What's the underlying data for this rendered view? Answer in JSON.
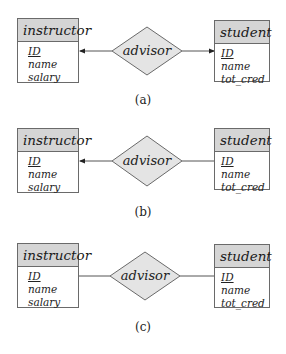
{
  "diagrams": [
    {
      "caption": "(a)",
      "left_entity": {
        "name": "instructor",
        "attributes": [
          {
            "label": "ID",
            "primary_key": true
          },
          {
            "label": "name"
          },
          {
            "label": "salary"
          }
        ]
      },
      "right_entity": {
        "name": "student",
        "attributes": [
          {
            "label": "ID",
            "primary_key": true
          },
          {
            "label": "name"
          },
          {
            "label": "tot_cred"
          }
        ]
      },
      "relationship": "advisor",
      "left_arrow": true,
      "right_arrow": true,
      "description": "one-to-one"
    },
    {
      "caption": "(b)",
      "left_entity": {
        "name": "instructor",
        "attributes": [
          {
            "label": "ID",
            "primary_key": true
          },
          {
            "label": "name"
          },
          {
            "label": "salary"
          }
        ]
      },
      "right_entity": {
        "name": "student",
        "attributes": [
          {
            "label": "ID",
            "primary_key": true
          },
          {
            "label": "name"
          },
          {
            "label": "tot_cred"
          }
        ]
      },
      "relationship": "advisor",
      "left_arrow": true,
      "right_arrow": false,
      "description": "one-to-many"
    },
    {
      "caption": "(c)",
      "left_entity": {
        "name": "instructor",
        "attributes": [
          {
            "label": "ID",
            "primary_key": true
          },
          {
            "label": "name"
          },
          {
            "label": "salary"
          }
        ]
      },
      "right_entity": {
        "name": "student",
        "attributes": [
          {
            "label": "ID",
            "primary_key": true
          },
          {
            "label": "name"
          },
          {
            "label": "tot_cred"
          }
        ]
      },
      "relationship": "advisor",
      "left_arrow": false,
      "right_arrow": false,
      "description": "many-to-many"
    }
  ],
  "colors": {
    "entity_header": "#d5d5d5",
    "relationship_fill": "#e4e4e4",
    "stroke": "#6a6a6a"
  }
}
